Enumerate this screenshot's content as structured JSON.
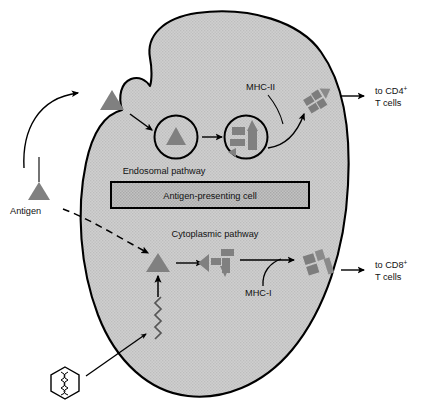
{
  "figure": {
    "colors": {
      "cell_fill": "#cccccc",
      "cell_stroke": "#000000",
      "antigen_fill": "#808080",
      "peptide_fill": "#808080",
      "mhc_fill": "#888888",
      "box_fill": "#bbbbbb",
      "stroke": "#000000",
      "text": "#111111",
      "virus_fill": "#ffffff"
    }
  },
  "labels": {
    "antigen": "Antigen",
    "cell_box": "Antigen-presenting cell",
    "endosomal_pathway": "Endosomal pathway",
    "cytoplasmic_pathway": "Cytoplasmic pathway",
    "mhc_ii": "MHC-II",
    "mhc_i": "MHC-I",
    "cd4_line1": "to CD4",
    "cd4_sup": "+",
    "cd4_line2": "T cells",
    "cd8_line1": "to CD8",
    "cd8_sup": "+",
    "cd8_line2": "T cells"
  },
  "elements": {
    "antigen_marker": "antigen-triangle",
    "engulfed_antigen": "antigen-triangle-at-membrane",
    "endosome_one": "endosome-vesicle-intact-antigen",
    "endosome_two": "endosome-vesicle-peptide-fragments",
    "cytoplasmic_antigen": "antigen-triangle-cytoplasm",
    "cytoplasmic_peptides": "peptide-fragments-cytoplasm",
    "mhc_ii_complex": "mhc-ii-surface-complex",
    "mhc_i_complex": "mhc-i-surface-complex",
    "virus": "virus-hexagon-particle",
    "nucleic_acid": "nucleic-acid-zigzag"
  }
}
